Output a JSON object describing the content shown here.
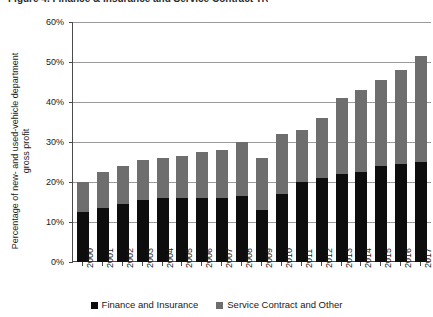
{
  "title_clipped": "Figure 4. Finance & Insurance and Service Contract Trends",
  "chart_data": {
    "type": "bar",
    "stacked": true,
    "title": "",
    "xlabel": "",
    "ylabel": "Percentage of new- and used-vehicle department\ngross profit",
    "ylim": [
      0,
      60
    ],
    "ytick_labels": [
      "0%",
      "10%",
      "20%",
      "30%",
      "40%",
      "50%",
      "60%"
    ],
    "ytick_values": [
      0,
      10,
      20,
      30,
      40,
      50,
      60
    ],
    "grid": true,
    "legend_position": "bottom",
    "categories": [
      "2000",
      "2001",
      "2002",
      "2003",
      "2004",
      "2005",
      "2006",
      "2007",
      "2008",
      "2009",
      "2010",
      "2011",
      "2012",
      "2013",
      "2014",
      "2015",
      "2016",
      "2017"
    ],
    "series": [
      {
        "name": "Finance and Insurance",
        "color": "#0d0d0d",
        "values": [
          12.5,
          13.5,
          14.5,
          15.5,
          16.0,
          16.0,
          16.0,
          16.0,
          16.5,
          13.0,
          17.0,
          20.0,
          21.0,
          22.0,
          22.5,
          24.0,
          24.5,
          25.0
        ]
      },
      {
        "name": "Service Contract and Other",
        "color": "#6e6e6e",
        "values": [
          7.5,
          9.0,
          9.5,
          10.0,
          10.0,
          10.5,
          11.5,
          12.0,
          13.5,
          13.0,
          15.0,
          13.0,
          15.0,
          19.0,
          20.5,
          21.5,
          23.5,
          26.5
        ]
      }
    ],
    "totals": [
      20.0,
      22.5,
      24.0,
      25.5,
      26.0,
      26.5,
      27.5,
      28.0,
      30.0,
      26.0,
      32.0,
      33.0,
      36.0,
      41.0,
      43.0,
      45.5,
      48.0,
      51.5
    ],
    "legend": [
      "Finance and Insurance",
      "Service Contract and Other"
    ]
  }
}
